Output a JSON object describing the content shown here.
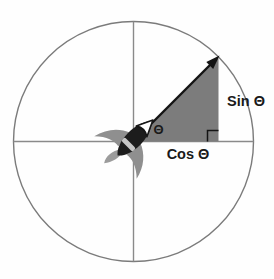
{
  "diagram": {
    "name": "unit-circle-sin-cos-diagram",
    "labels": {
      "sin": "Sin Θ",
      "cos": "Cos Θ",
      "theta": "Θ"
    },
    "colors": {
      "background": "#fefefe",
      "circle_stroke": "#7b7b7b",
      "axis_stroke": "#8a8a8a",
      "triangle_fill": "#7c7c7c",
      "arrow": "#141414",
      "right_angle_marker": "#141414",
      "text": "#1a1a1a",
      "rocket_body": "#1c1c1c",
      "rocket_fin": "#8f8f8f",
      "rocket_flame": "#9c9c9c",
      "rocket_nose": "#ffffff",
      "rocket_band": "#c6c6c6"
    }
  }
}
